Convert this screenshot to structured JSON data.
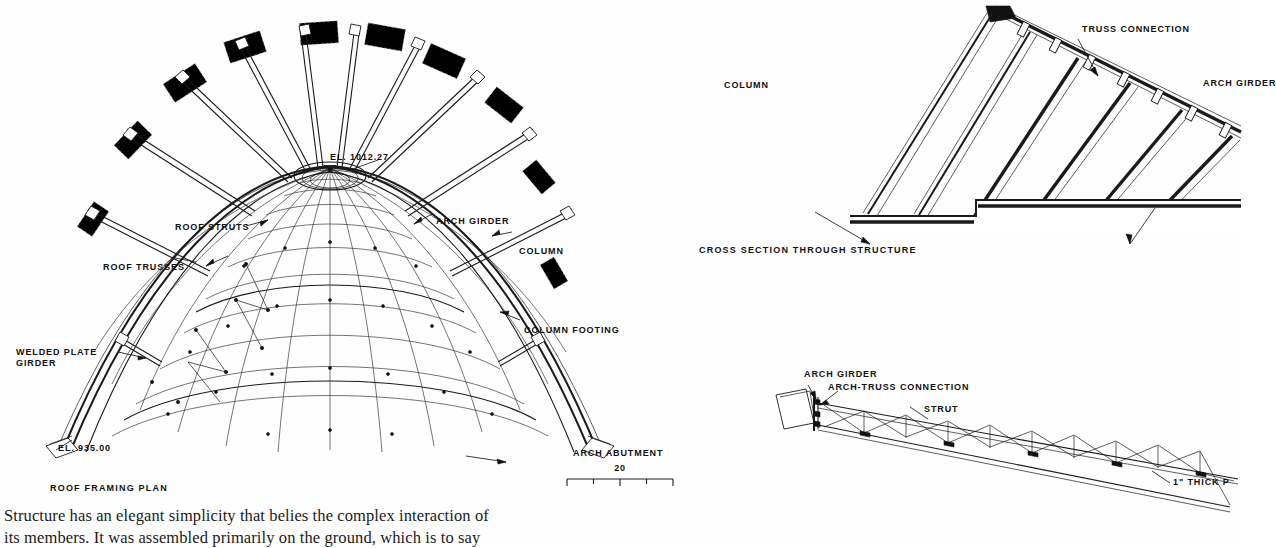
{
  "document": {
    "type": "engineering-drawing-page",
    "ink_color": "#1a1a1a",
    "paper_color": "#ffffff"
  },
  "plan": {
    "caption": "ROOF FRAMING PLAN",
    "labels": {
      "apex_elevation": "EL. 1012.27",
      "base_elevation": "EL. 935.00",
      "roof_struts": "ROOF STRUTS",
      "roof_trusses": "ROOF TRUSSES",
      "arch_girder": "ARCH GIRDER",
      "column": "COLUMN",
      "column_footing": "COLUMN FOOTING",
      "welded_plate_girder": "WELDED PLATE\nGIRDER",
      "arch_abutment": "ARCH ABUTMENT"
    },
    "scale": {
      "value": "20",
      "segments": 4
    }
  },
  "section": {
    "caption": "CROSS SECTION THROUGH STRUCTURE",
    "labels": {
      "column": "COLUMN",
      "truss_connection": "TRUSS CONNECTION",
      "arch_girder": "ARCH GIRDER"
    }
  },
  "truss_detail": {
    "labels": {
      "arch_girder": "ARCH GIRDER",
      "arch_truss_connection": "ARCH-TRUSS CONNECTION",
      "strut": "STRUT",
      "thick_plate": "1\" THICK P"
    }
  },
  "body_text": {
    "line1": "Structure has an elegant simplicity that belies the complex interaction of",
    "line2": "its members. It was assembled primarily on the ground, which is to say"
  }
}
